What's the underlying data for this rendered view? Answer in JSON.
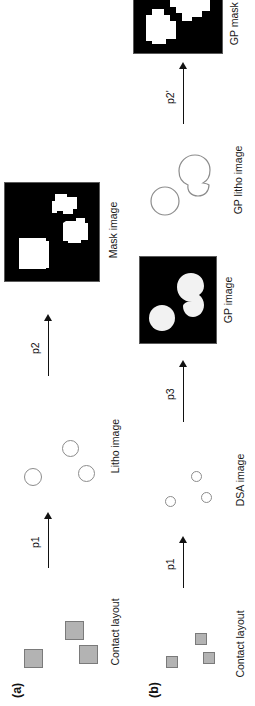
{
  "figure": {
    "orientation": "rotated-90-ccw",
    "background_color": "#ffffff",
    "panels": [
      {
        "tag": "(a)",
        "stages": [
          {
            "id": "a-contact-layout",
            "caption": "Contact layout",
            "kind": "scatter-squares",
            "marker_fill": "#b3b3b3",
            "marker_stroke": "#7a7a7a",
            "markers": [
              {
                "x": 16,
                "y": 18,
                "w": 19,
                "h": 19
              },
              {
                "x": 44,
                "y": 59,
                "w": 19,
                "h": 19
              },
              {
                "x": 20,
                "y": 73,
                "w": 19,
                "h": 19
              }
            ]
          },
          {
            "id": "a-litho-image",
            "caption": "Litho image",
            "kind": "scatter-circles",
            "marker_stroke": "#8c8c8c",
            "markers": [
              {
                "x": 12,
                "y": 18,
                "w": 18,
                "h": 18
              },
              {
                "x": 41,
                "y": 56,
                "w": 17,
                "h": 17
              },
              {
                "x": 16,
                "y": 72,
                "w": 17,
                "h": 17
              }
            ]
          },
          {
            "id": "a-mask-image",
            "caption": "Mask image",
            "kind": "black-mask",
            "background_color": "#000000",
            "feature_color": "#ffffff"
          }
        ],
        "arrows": [
          {
            "label": "p1"
          },
          {
            "label": "p2"
          }
        ]
      },
      {
        "tag": "(b)",
        "stages": [
          {
            "id": "b-contact-layout",
            "caption": "Contact layout",
            "kind": "scatter-squares",
            "marker_fill": "#b3b3b3",
            "marker_stroke": "#7a7a7a",
            "markers": [
              {
                "x": 20,
                "y": 33,
                "w": 12,
                "h": 12
              },
              {
                "x": 43,
                "y": 62,
                "w": 12,
                "h": 12
              },
              {
                "x": 24,
                "y": 70,
                "w": 12,
                "h": 12
              }
            ]
          },
          {
            "id": "b-dsa-image",
            "caption": "DSA image",
            "kind": "scatter-circles",
            "marker_stroke": "#8c8c8c",
            "markers": [
              {
                "x": 17,
                "y": 32,
                "w": 11,
                "h": 11
              },
              {
                "x": 42,
                "y": 58,
                "w": 11,
                "h": 11
              },
              {
                "x": 21,
                "y": 68,
                "w": 11,
                "h": 11
              }
            ]
          },
          {
            "id": "b-gp-image",
            "caption": "GP image",
            "kind": "black-blobs",
            "background_color": "#000000",
            "feature_color": "#f2f2f2"
          },
          {
            "id": "b-gp-litho-image",
            "caption": "GP litho image",
            "kind": "outline-blobs",
            "marker_stroke": "#8c8c8c"
          },
          {
            "id": "b-gp-mask-image",
            "caption": "GP mask image",
            "kind": "black-mask-gp",
            "background_color": "#000000",
            "feature_color": "#ffffff"
          }
        ],
        "arrows": [
          {
            "label": "p1"
          },
          {
            "label": "p3"
          },
          {
            "label": "p2'"
          }
        ]
      }
    ]
  }
}
